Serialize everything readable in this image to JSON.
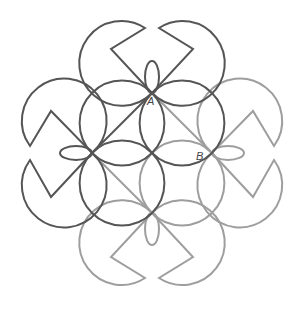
{
  "diagram": {
    "type": "geometric-pattern",
    "colors": {
      "dark": "#555555",
      "light": "#9e9e9e",
      "background": "#ffffff"
    },
    "stroke_width": 2,
    "circle_radius": 42.4,
    "labels": [
      {
        "id": "A",
        "text": "A",
        "x": 147,
        "y": 105
      },
      {
        "id": "B",
        "text": "B",
        "x": 196,
        "y": 160
      }
    ],
    "inner_circles": [
      {
        "cx": 122,
        "cy": 123,
        "tone": "dark"
      },
      {
        "cx": 182,
        "cy": 123,
        "tone": "dark"
      },
      {
        "cx": 122,
        "cy": 183,
        "tone": "dark"
      },
      {
        "cx": 182,
        "cy": 183,
        "tone": "light"
      }
    ],
    "pacmen": [
      {
        "name": "top-left",
        "tone": "dark",
        "p1": [
          145,
          28
        ],
        "p2": [
          152,
          93
        ],
        "v": [
          111,
          49
        ],
        "sweep": 0
      },
      {
        "name": "top-right",
        "tone": "dark",
        "p1": [
          159,
          28
        ],
        "p2": [
          152,
          93
        ],
        "v": [
          193,
          49
        ],
        "sweep": 1
      },
      {
        "name": "left-upper",
        "tone": "dark",
        "p1": [
          30,
          146
        ],
        "p2": [
          92,
          153
        ],
        "v": [
          51,
          111
        ],
        "sweep": 1
      },
      {
        "name": "left-lower",
        "tone": "dark",
        "p1": [
          30,
          160
        ],
        "p2": [
          92,
          153
        ],
        "v": [
          51,
          197
        ],
        "sweep": 0
      },
      {
        "name": "right-upper",
        "tone": "light",
        "p1": [
          274,
          146
        ],
        "p2": [
          212,
          153
        ],
        "v": [
          253,
          111
        ],
        "sweep": 0
      },
      {
        "name": "right-lower",
        "tone": "light",
        "p1": [
          274,
          160
        ],
        "p2": [
          212,
          153
        ],
        "v": [
          253,
          197
        ],
        "sweep": 1
      },
      {
        "name": "bottom-left",
        "tone": "light",
        "p1": [
          145,
          278
        ],
        "p2": [
          152,
          213
        ],
        "v": [
          111,
          257
        ],
        "sweep": 1
      },
      {
        "name": "bottom-right",
        "tone": "light",
        "p1": [
          159,
          278
        ],
        "p2": [
          152,
          213
        ],
        "v": [
          193,
          257
        ],
        "sweep": 0
      }
    ],
    "petals": [
      {
        "name": "top",
        "cx": 152,
        "cy": 77,
        "rx": 7,
        "ry": 16,
        "tone": "dark"
      },
      {
        "name": "left",
        "cx": 76,
        "cy": 153,
        "rx": 16,
        "ry": 7,
        "tone": "dark"
      },
      {
        "name": "right",
        "cx": 228,
        "cy": 153,
        "rx": 16,
        "ry": 7,
        "tone": "light"
      },
      {
        "name": "bottom",
        "cx": 152,
        "cy": 229,
        "rx": 7,
        "ry": 16,
        "tone": "light"
      }
    ],
    "diagonals": [
      {
        "from": [
          152,
          93
        ],
        "to": [
          92,
          153
        ],
        "tone": "dark"
      },
      {
        "from": [
          152,
          93
        ],
        "to": [
          212,
          153
        ],
        "tone": "light"
      },
      {
        "from": [
          92,
          153
        ],
        "to": [
          152,
          213
        ],
        "tone": "light"
      }
    ]
  }
}
